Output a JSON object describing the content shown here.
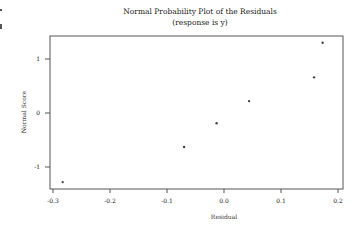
{
  "chart_data": {
    "type": "scatter",
    "title": "Normal Probability Plot of the Residuals",
    "subtitle": "(response is y)",
    "xlabel": "Residual",
    "ylabel": "Normal Score",
    "xlim": [
      -0.305,
      0.21
    ],
    "ylim": [
      -1.42,
      1.42
    ],
    "x_ticks": [
      -0.3,
      -0.2,
      -0.1,
      0.0,
      0.1,
      0.2
    ],
    "x_tick_labels": [
      "-0.3",
      "-0.2",
      "-0.1",
      "0.0",
      "0.1",
      "0.2"
    ],
    "y_ticks": [
      1,
      0,
      -1
    ],
    "y_tick_labels": [
      "1",
      "0",
      "-1"
    ],
    "grid": false,
    "legend": null,
    "points": [
      {
        "x": -0.283,
        "y": -1.28
      },
      {
        "x": -0.07,
        "y": -0.63
      },
      {
        "x": -0.013,
        "y": -0.19
      },
      {
        "x": 0.044,
        "y": 0.22
      },
      {
        "x": 0.158,
        "y": 0.66
      },
      {
        "x": 0.173,
        "y": 1.3
      }
    ],
    "colors": {
      "axis": "#555555",
      "marker": "#444444",
      "text": "#222222"
    }
  }
}
